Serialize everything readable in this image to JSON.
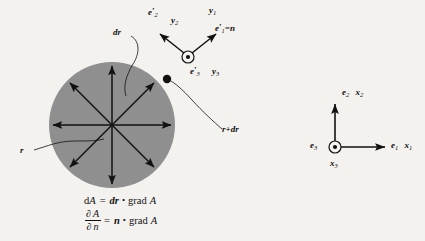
{
  "figure": {
    "background_color": "#f4f2ef",
    "ink_color": "#111111",
    "disk_fill_color": "#8f8f8f"
  },
  "disk": {
    "center_x": 112,
    "center_y": 125,
    "radius": 63,
    "radial_arrow_count": 8,
    "boundary_point_label": "surface-point-dot"
  },
  "labels": {
    "dr": "dr",
    "r": "r",
    "r_plus_dr": "r+dr",
    "e2_prime": "e",
    "e2_prime_sub": "2",
    "y2": "y",
    "y2_sub": "2",
    "y1": "y",
    "y1_sub": "1",
    "e1_prime_eq_n": "=n",
    "e1_prime": "e",
    "e1_prime_sub": "1",
    "e3_prime": "e",
    "e3_prime_sub": "3",
    "y3": "y",
    "y3_sub": "3",
    "e2": "e",
    "e2_sub": "2",
    "x2": "x",
    "x2_sub": "2",
    "e1": "e",
    "e1_sub": "1",
    "x1": "x",
    "x1_sub": "1",
    "e3": "e",
    "e3_sub": "3",
    "x3": "x",
    "x3_sub": "3",
    "prime_mark": "′"
  },
  "equations": {
    "line1": {
      "lhs_d": "d",
      "lhs_A": "A",
      "equals": "=",
      "dr": "dr",
      "dot": "•",
      "grad": "grad",
      "rhs_A": "A"
    },
    "line2": {
      "numerator_partial": "∂",
      "numerator_A": "A",
      "denominator_partial": "∂",
      "denominator_n": "n",
      "equals": "=",
      "n": "n",
      "dot": "•",
      "grad": "grad",
      "rhs_A": "A"
    }
  },
  "axes_right": {
    "origin_x": 335,
    "origin_y": 147,
    "vertical_label": "e2 x2",
    "horizontal_label": "e1 x1",
    "out_of_page_label": "e3 x3"
  }
}
